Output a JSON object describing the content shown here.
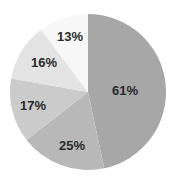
{
  "chart_data": {
    "type": "pie",
    "title": "",
    "start_angle_deg": 0,
    "direction": "clockwise",
    "note": "Displayed labels sum to 132%, so they do not correspond to slice proportions; slice angles were measured from the image.",
    "categories": [
      "61%",
      "25%",
      "17%",
      "16%",
      "13%"
    ],
    "labels": [
      "61%",
      "25%",
      "17%",
      "16%",
      "13%"
    ],
    "label_values": [
      61,
      25,
      17,
      16,
      13
    ],
    "slice_angles_deg": [
      168,
      64,
      48,
      43,
      37
    ],
    "slice_share_pct": [
      46.6,
      17.8,
      13.3,
      11.9,
      10.4
    ],
    "colors": [
      "#a7a7a7",
      "#b8b8b8",
      "#cbcbcb",
      "#e3e3e3",
      "#f7f7f7"
    ],
    "center": [
      88,
      92
    ],
    "radius": 78,
    "legend": null,
    "grid": false
  }
}
